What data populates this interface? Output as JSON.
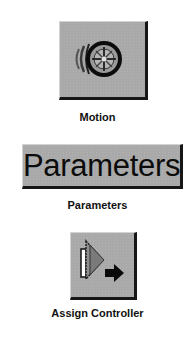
{
  "buttons": [
    {
      "id": "motion",
      "icon": "motion-wheel-icon",
      "label": "Motion"
    },
    {
      "id": "parameters",
      "button_text": "Parameters",
      "label": "Parameters"
    },
    {
      "id": "assign-controller",
      "icon": "assign-controller-icon",
      "label": "Assign Controller"
    }
  ],
  "colors": {
    "button_face": "#a9a9a9",
    "button_shadow": "#161616",
    "text": "#111111"
  }
}
